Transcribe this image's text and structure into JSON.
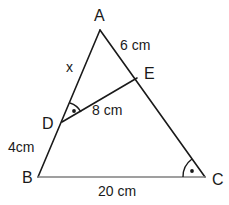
{
  "figure": {
    "background_color": "#ffffff",
    "stroke_color": "#1a1a1a",
    "baseline_color": "#808080",
    "vertices": [
      {
        "name": "A",
        "label": "A",
        "x": 100,
        "y": 30
      },
      {
        "name": "B",
        "label": "B",
        "x": 38,
        "y": 177
      },
      {
        "name": "C",
        "label": "C",
        "x": 205,
        "y": 177
      },
      {
        "name": "D",
        "label": "D",
        "x": 62,
        "y": 122
      },
      {
        "name": "E",
        "label": "E",
        "x": 137,
        "y": 78
      }
    ],
    "segments": [
      {
        "name": "side-ab",
        "from": "A",
        "to": "B",
        "color": "#1a1a1a"
      },
      {
        "name": "side-ac",
        "from": "A",
        "to": "C",
        "color": "#1a1a1a"
      },
      {
        "name": "side-bc",
        "from": "B",
        "to": "C",
        "color": "#808080"
      },
      {
        "name": "segment-de",
        "from": "D",
        "to": "E",
        "color": "#1a1a1a"
      }
    ],
    "measure_labels": {
      "ae": "6 cm",
      "ad": "x",
      "de": "8 cm",
      "bd": "4cm",
      "bc": "20 cm"
    },
    "angle_marks": [
      {
        "name": "angle-ade",
        "vertex": "D",
        "marker": "arc-with-dot"
      },
      {
        "name": "angle-bce",
        "vertex": "C",
        "marker": "arc-with-dot"
      }
    ]
  }
}
